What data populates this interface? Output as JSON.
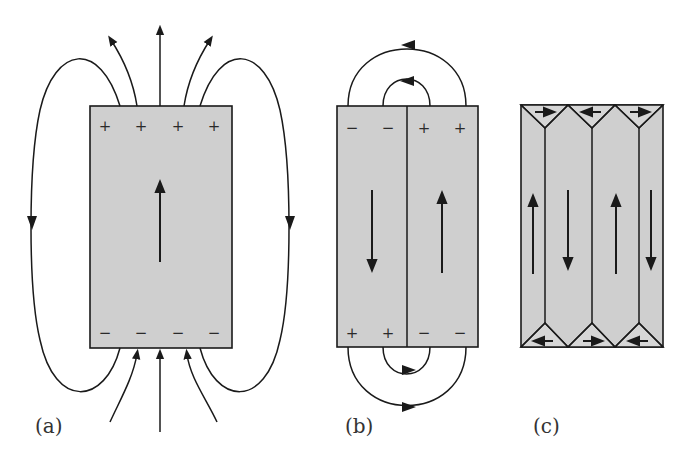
{
  "figure": {
    "colors": {
      "domain_fill": "#cfcfcf",
      "stroke": "#1a1a1a"
    },
    "panels": [
      {
        "id": "a",
        "label": "(a)",
        "domains": 1,
        "magnetization": [
          "up"
        ],
        "top_charges": [
          "+",
          "+",
          "+",
          "+"
        ],
        "bottom_charges": [
          "−",
          "−",
          "−",
          "−"
        ],
        "field_lines": 7
      },
      {
        "id": "b",
        "label": "(b)",
        "domains": 2,
        "magnetization": [
          "down",
          "up"
        ],
        "top_charges": [
          "−",
          "−",
          "+",
          "+"
        ],
        "bottom_charges": [
          "+",
          "+",
          "−",
          "−"
        ],
        "field_loops": 4
      },
      {
        "id": "c",
        "label": "(c)",
        "domains": 4,
        "magnetization": [
          "up",
          "down",
          "up",
          "down"
        ],
        "closure_domains_top": [
          "right",
          "left",
          "right"
        ],
        "closure_domains_bottom": [
          "left",
          "right",
          "left"
        ]
      }
    ]
  }
}
